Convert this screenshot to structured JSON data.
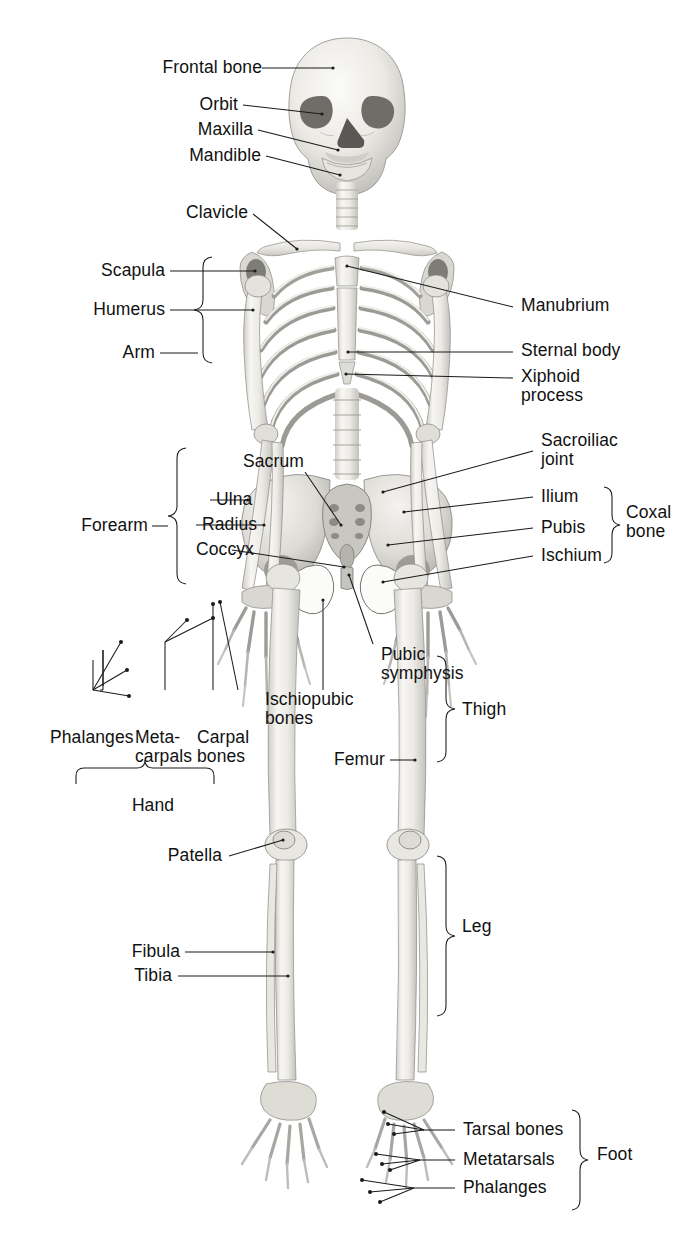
{
  "figure": {
    "background_color": "#ffffff",
    "label_color": "#111111",
    "leader_line_color": "#1a1a1a",
    "bone_fill_color": "#f3f2ef",
    "bone_shadow_color": "#b9b7b1",
    "view": "anterior"
  },
  "labels": {
    "frontal_bone": "Frontal bone",
    "orbit": "Orbit",
    "maxilla": "Maxilla",
    "mandible": "Mandible",
    "clavicle": "Clavicle",
    "scapula": "Scapula",
    "humerus": "Humerus",
    "arm": "Arm",
    "forearm": "Forearm",
    "ulna": "Ulna",
    "radius": "Radius",
    "coccyx": "Coccyx",
    "sacrum": "Sacrum",
    "phalanges_hand": "Phalanges",
    "metacarpals_line1": "Meta-",
    "metacarpals_line2": "carpals",
    "carpal_line1": "Carpal",
    "carpal_line2": "bones",
    "hand": "Hand",
    "manubrium": "Manubrium",
    "sternal_body": "Sternal body",
    "xiphoid_line1": "Xiphoid",
    "xiphoid_line2": "process",
    "sacroiliac_line1": "Sacroiliac",
    "sacroiliac_line2": "joint",
    "ilium": "Ilium",
    "pubis": "Pubis",
    "ischium": "Ischium",
    "coxal_line1": "Coxal",
    "coxal_line2": "bone",
    "pubic_line1": "Pubic",
    "pubic_line2": "symphysis",
    "ischiopubic_line1": "Ischiopubic",
    "ischiopubic_line2": "bones",
    "femur": "Femur",
    "thigh": "Thigh",
    "patella": "Patella",
    "fibula": "Fibula",
    "tibia": "Tibia",
    "leg": "Leg",
    "tarsal_bones": "Tarsal bones",
    "metatarsals": "Metatarsals",
    "phalanges_foot": "Phalanges",
    "foot": "Foot"
  },
  "label_groups": {
    "skull": [
      "Frontal bone",
      "Orbit",
      "Maxilla",
      "Mandible"
    ],
    "shoulder_girdle": [
      "Clavicle",
      "Scapula"
    ],
    "upper_limb": [
      "Humerus",
      "Arm",
      "Forearm",
      "Ulna",
      "Radius",
      "Phalanges",
      "Meta-carpals",
      "Carpal bones",
      "Hand"
    ],
    "thorax": [
      "Manubrium",
      "Sternal body",
      "Xiphoid process"
    ],
    "vertebral_pelvic": [
      "Sacrum",
      "Coccyx",
      "Sacroiliac joint",
      "Ilium",
      "Pubis",
      "Ischium",
      "Coxal bone",
      "Pubic symphysis",
      "Ischiopubic bones"
    ],
    "lower_limb": [
      "Femur",
      "Thigh",
      "Patella",
      "Fibula",
      "Tibia",
      "Leg",
      "Tarsal bones",
      "Metatarsals",
      "Phalanges",
      "Foot"
    ]
  },
  "braces": {
    "arm": "Arm",
    "forearm": "Forearm",
    "hand": "Hand",
    "coxal_bone": "Coxal bone",
    "thigh": "Thigh",
    "leg": "Leg",
    "foot": "Foot"
  }
}
